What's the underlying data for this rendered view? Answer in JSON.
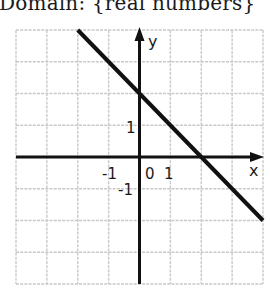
{
  "caption": "Domain: {real numbers}",
  "chart_data": {
    "type": "line",
    "title": "",
    "xlabel": "x",
    "ylabel": "y",
    "xlim": [
      -4,
      4
    ],
    "ylim": [
      -4,
      4
    ],
    "grid": true,
    "x_tick_labels": [
      "-1",
      "0",
      "1"
    ],
    "y_tick_labels": [
      "1",
      "-1"
    ],
    "series": [
      {
        "name": "y = -x + 2",
        "x": [
          -2,
          0,
          2,
          4
        ],
        "y": [
          4,
          2,
          0,
          -2
        ]
      }
    ],
    "annotations": {
      "y_intercept": 2,
      "x_intercept": 2,
      "slope": -1
    },
    "colors": {
      "line": "#111111",
      "axis": "#111111",
      "grid": "#c9c9c9"
    }
  }
}
